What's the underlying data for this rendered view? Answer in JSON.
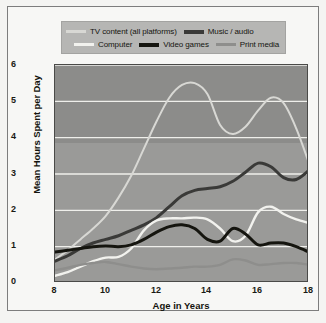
{
  "legend": {
    "items": [
      {
        "label": "TV content (all platforms)",
        "color": "#d8d8d4",
        "key": "tv"
      },
      {
        "label": "Music / audio",
        "color": "#3a3a38",
        "key": "music"
      },
      {
        "label": "Computer",
        "color": "#f2f2ee",
        "key": "computer"
      },
      {
        "label": "Video games",
        "color": "#15150f",
        "key": "videogames"
      },
      {
        "label": "Print media",
        "color": "#8e8e8c",
        "key": "print"
      }
    ]
  },
  "chart_data": {
    "type": "line",
    "title": "",
    "xlabel": "Age in Years",
    "ylabel": "Mean Hours Spent per Day",
    "xlim": [
      8,
      18
    ],
    "ylim": [
      0,
      6
    ],
    "xticks": [
      8,
      10,
      12,
      14,
      16,
      18
    ],
    "yticks": [
      0,
      1,
      2,
      3,
      4,
      5,
      6
    ],
    "grid": "horizontal",
    "grid_color": "#efefeb",
    "plot_background": "#9a9a98",
    "legend_position": "top",
    "x": [
      8,
      8.5,
      9,
      9.5,
      10,
      10.5,
      11,
      11.5,
      12,
      12.5,
      13,
      13.5,
      14,
      14.5,
      15,
      15.5,
      16,
      16.5,
      17,
      17.5,
      18
    ],
    "series": [
      {
        "name": "TV content (all platforms)",
        "color": "#d8d8d4",
        "width": 2.0,
        "values": [
          0.65,
          0.9,
          1.2,
          1.5,
          1.85,
          2.35,
          2.95,
          3.7,
          4.45,
          5.1,
          5.45,
          5.5,
          5.2,
          4.35,
          4.1,
          4.3,
          4.75,
          5.1,
          4.95,
          4.25,
          3.3
        ]
      },
      {
        "name": "Music / audio",
        "color": "#3a3a38",
        "width": 3.0,
        "values": [
          0.6,
          0.75,
          0.95,
          1.1,
          1.2,
          1.3,
          1.45,
          1.6,
          1.8,
          2.1,
          2.4,
          2.55,
          2.6,
          2.65,
          2.8,
          3.05,
          3.3,
          3.2,
          2.9,
          2.85,
          3.1
        ]
      },
      {
        "name": "Computer",
        "color": "#f2f2ee",
        "width": 2.4,
        "values": [
          0.2,
          0.3,
          0.45,
          0.6,
          0.7,
          0.72,
          0.95,
          1.45,
          1.72,
          1.78,
          1.78,
          1.8,
          1.75,
          1.5,
          1.15,
          1.3,
          1.95,
          2.1,
          1.9,
          1.75,
          1.65
        ]
      },
      {
        "name": "Video games",
        "color": "#15150f",
        "width": 3.0,
        "values": [
          0.85,
          0.9,
          0.95,
          1.0,
          1.02,
          1.0,
          1.05,
          1.2,
          1.4,
          1.55,
          1.6,
          1.5,
          1.2,
          1.15,
          1.5,
          1.35,
          1.05,
          1.1,
          1.1,
          1.0,
          0.85
        ]
      },
      {
        "name": "Print media",
        "color": "#8e8e8c",
        "width": 2.4,
        "values": [
          0.35,
          0.42,
          0.5,
          0.55,
          0.58,
          0.52,
          0.45,
          0.4,
          0.38,
          0.4,
          0.42,
          0.45,
          0.45,
          0.5,
          0.65,
          0.62,
          0.5,
          0.52,
          0.55,
          0.55,
          0.5
        ]
      }
    ]
  }
}
